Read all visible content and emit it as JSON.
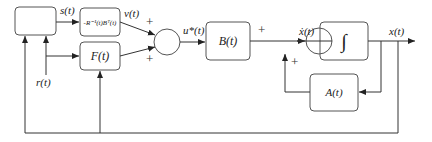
{
  "diagram": {
    "type": "control block diagram",
    "blocks": {
      "unlabeled": "",
      "gain": "-R⁻¹(t)Bᵀ(t)",
      "feedforward": "F(t)",
      "input": "B(t)",
      "integrator": "∫",
      "state": "A(t)"
    },
    "signals": {
      "s": "s(t)",
      "v": "v(t)",
      "r": "r(t)",
      "u": "u*(t)",
      "xdot": "ẋ(t)",
      "x": "x(t)"
    },
    "signs": [
      "+",
      "+",
      "+",
      "+"
    ]
  }
}
